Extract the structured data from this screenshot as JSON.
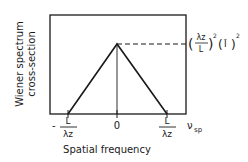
{
  "diagram": {
    "type": "triangle-function-plot",
    "y_axis_label_line1": "Wiener spectrum",
    "y_axis_label_line2": "cross-section",
    "x_axis_label": "Spatial frequency",
    "x_axis_variable": "ν",
    "x_axis_variable_sub": "sp",
    "ticks": {
      "left": {
        "sign": "-",
        "numerator": "L",
        "denominator": "λz"
      },
      "center": {
        "label": "0"
      },
      "right": {
        "numerator": "L",
        "denominator": "λz"
      }
    },
    "peak_label": {
      "frac_numerator": "λz",
      "frac_denominator": "L",
      "exp1": "2",
      "ibar": "Ī",
      "exp2": "2"
    },
    "colors": {
      "ink": "#1a1a1a",
      "background": "#ffffff"
    }
  }
}
